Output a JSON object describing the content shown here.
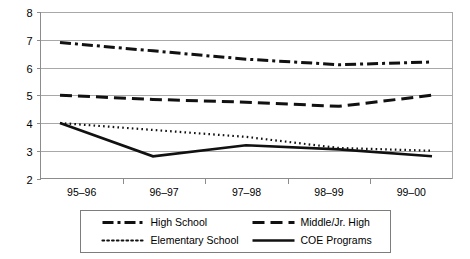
{
  "chart_data": {
    "type": "line",
    "title": "",
    "xlabel": "",
    "ylabel": "",
    "ylim": [
      2,
      8
    ],
    "ytick_labels": [
      "2",
      "3",
      "4",
      "5",
      "6",
      "7",
      "8"
    ],
    "grid": true,
    "legend_position": "bottom",
    "categories": [
      "95–96",
      "96–97",
      "97–98",
      "98–99",
      "99–00"
    ],
    "series": [
      {
        "name": "High School",
        "style": "dash-dot",
        "color": "#111111",
        "values": [
          6.9,
          6.6,
          6.3,
          6.1,
          6.2
        ]
      },
      {
        "name": "Middle/Jr. High",
        "style": "dashed",
        "color": "#111111",
        "values": [
          5.0,
          4.85,
          4.75,
          4.6,
          5.0
        ]
      },
      {
        "name": "Elementary School",
        "style": "dotted",
        "color": "#111111",
        "values": [
          4.0,
          3.75,
          3.5,
          3.1,
          3.0
        ]
      },
      {
        "name": "COE Programs",
        "style": "solid",
        "color": "#111111",
        "values": [
          4.0,
          2.8,
          3.2,
          3.05,
          2.8
        ]
      }
    ]
  },
  "legend": {
    "entries": [
      {
        "label": "High School",
        "style": "dash-dot"
      },
      {
        "label": "Middle/Jr. High",
        "style": "dashed"
      },
      {
        "label": "Elementary School",
        "style": "dotted"
      },
      {
        "label": "COE Programs",
        "style": "solid"
      }
    ]
  },
  "axes": {
    "y_ticks": [
      "8",
      "7",
      "6",
      "5",
      "4",
      "3",
      "2"
    ],
    "x_ticks": [
      "95–96",
      "96–97",
      "97–98",
      "98–99",
      "99–00"
    ]
  }
}
